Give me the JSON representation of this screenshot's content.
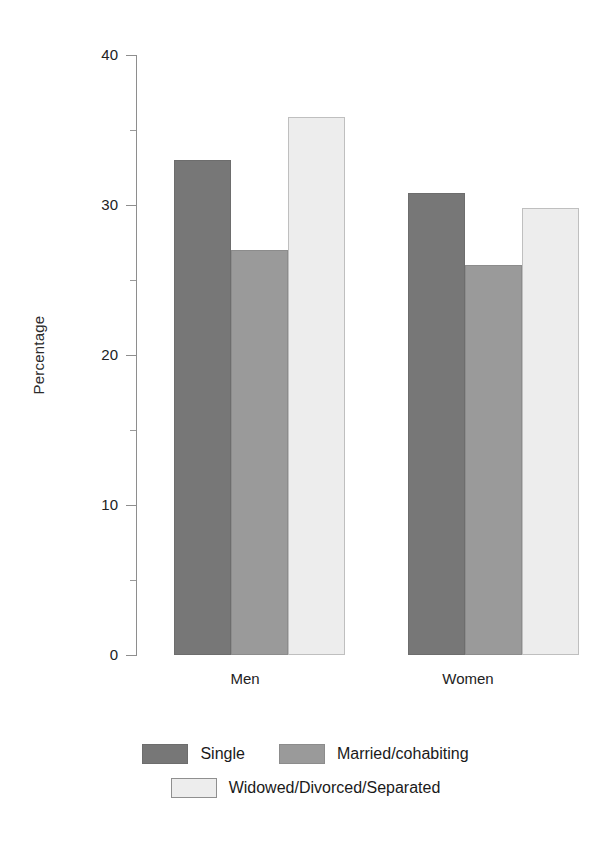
{
  "chart_data": {
    "type": "bar",
    "title": "",
    "xlabel": "",
    "ylabel": "Percentage",
    "categories": [
      "Men",
      "Women"
    ],
    "series": [
      {
        "name": "Single",
        "color": "#777777",
        "values": [
          33.0,
          30.8
        ]
      },
      {
        "name": "Married/cohabiting",
        "color": "#9a9a9a",
        "values": [
          27.0,
          26.0
        ]
      },
      {
        "name": "Widowed/Divorced/Separated",
        "color": "#ededed",
        "values": [
          35.9,
          29.8
        ]
      }
    ],
    "ylim": [
      0,
      40
    ],
    "yticks": [
      0,
      10,
      20,
      30,
      40
    ],
    "ytick_labels": [
      "0",
      "10",
      "20",
      "30",
      "40"
    ],
    "yminor_ticks": [
      5,
      15,
      25,
      35
    ],
    "grid": false,
    "legend_position": "bottom",
    "bar_grouping": "adjacent-no-gap"
  },
  "axis": {
    "y_title": "Percentage",
    "tick_labels": [
      "40",
      "30",
      "20",
      "10",
      "0"
    ]
  },
  "categories": [
    {
      "label": "Men"
    },
    {
      "label": "Women"
    }
  ],
  "legend": {
    "rows": [
      [
        {
          "label": "Single",
          "swatch": "sw-single"
        },
        {
          "label": "Married/cohabiting",
          "swatch": "sw-married"
        }
      ],
      [
        {
          "label": "Widowed/Divorced/Separated",
          "swatch": "sw-widowed"
        }
      ]
    ]
  }
}
